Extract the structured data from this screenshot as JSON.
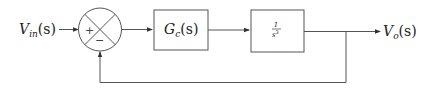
{
  "diagram": {
    "type": "block-diagram",
    "input": {
      "symbol": "V",
      "subscript": "in",
      "arg": "(s)"
    },
    "output": {
      "symbol": "V",
      "subscript": "o",
      "arg": "(s)"
    },
    "summing_junction": {
      "plus_sign": "+",
      "minus_sign": "−"
    },
    "blocks": [
      {
        "id": "controller",
        "symbol": "G",
        "subscript": "c",
        "arg": "(s)"
      },
      {
        "id": "plant",
        "numerator": "1",
        "denominator_base": "s",
        "denominator_exp": "3"
      }
    ],
    "feedback": "unity negative feedback from output to summing junction"
  },
  "colors": {
    "stroke": "#555555",
    "text": "#222222",
    "background": "#ffffff"
  }
}
